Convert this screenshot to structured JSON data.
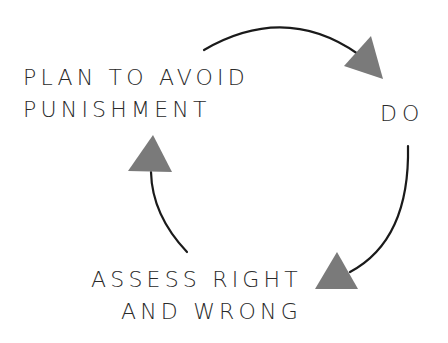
{
  "diagram": {
    "type": "cycle",
    "nodes": [
      {
        "id": "plan",
        "lines": [
          "PLAN TO AVOID",
          "PUNISHMENT"
        ]
      },
      {
        "id": "do",
        "lines": [
          "DO"
        ]
      },
      {
        "id": "assess",
        "lines": [
          "ASSESS RIGHT",
          "AND WRONG"
        ]
      }
    ],
    "edges": [
      {
        "from": "plan",
        "to": "do"
      },
      {
        "from": "do",
        "to": "assess"
      },
      {
        "from": "assess",
        "to": "plan"
      }
    ],
    "colors": {
      "text": "#2a2a2a",
      "arc": "#1a1a1a",
      "arrowhead": "#7a7a7a",
      "background": "#ffffff"
    }
  }
}
